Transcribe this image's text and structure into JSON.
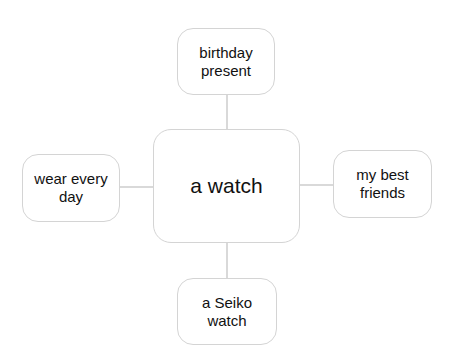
{
  "diagram": {
    "type": "mind-map",
    "center": {
      "label": "a watch"
    },
    "branches": {
      "top": {
        "label": "birthday present"
      },
      "left": {
        "label": "wear every day"
      },
      "right": {
        "label": "my best friends"
      },
      "bottom": {
        "label": "a Seiko watch"
      }
    },
    "colors": {
      "border": "#d4d4d4",
      "connector": "#d9d9d9",
      "text": "#111111"
    }
  }
}
